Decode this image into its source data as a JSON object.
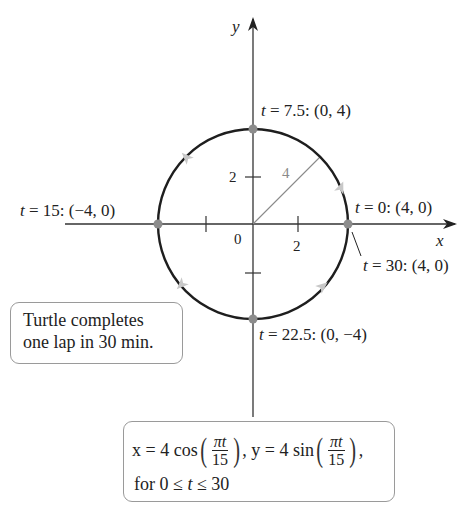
{
  "diagram": {
    "type": "parametric-circle",
    "axes": {
      "x_label": "x",
      "y_label": "y",
      "origin_label": "0",
      "x_ticks": [
        {
          "value": -2,
          "label": ""
        },
        {
          "value": 2,
          "label": "2"
        }
      ],
      "y_ticks": [
        {
          "value": 2,
          "label": "2"
        },
        {
          "value": -2,
          "label": ""
        }
      ]
    },
    "circle": {
      "radius": 4,
      "radius_label": "4",
      "direction": "counterclockwise"
    },
    "points": [
      {
        "id": "t0",
        "label_t": "t",
        "label_rest": " = 0: (4, 0)"
      },
      {
        "id": "t7_5",
        "label_t": "t",
        "label_rest": " = 7.5: (0, 4)"
      },
      {
        "id": "t15",
        "label_t": "t",
        "label_rest": " = 15: (−4, 0)"
      },
      {
        "id": "t22_5",
        "label_t": "t",
        "label_rest": " = 22.5: (0, −4)"
      },
      {
        "id": "t30",
        "label_t": "t",
        "label_rest": " = 30: (4, 0)"
      }
    ],
    "colors": {
      "axis": "#333333",
      "circle": "#1e1e1e",
      "point": "#8c8c8c",
      "radius_line": "#8a8a8a",
      "direction_arrow": "#c8c8c8",
      "box_border": "#9a9a9a"
    }
  },
  "notes": {
    "turtle_line1": "Turtle completes",
    "turtle_line2": "one lap in 30 min."
  },
  "equation": {
    "x_part": "x = 4 cos",
    "y_part": ", y = 4 sin",
    "frac_num": "πt",
    "frac_den": "15",
    "trail": ",",
    "domain_for": "for 0 ≤ ",
    "domain_t": "t",
    "domain_end": " ≤ 30"
  }
}
